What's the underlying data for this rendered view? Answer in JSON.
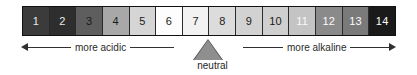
{
  "figure": {
    "name": "ph-scale",
    "background": "#ffffff"
  },
  "scale": {
    "cells": [
      {
        "label": "1",
        "fill": "#3b3b3b",
        "text_color": "#e8e8e8"
      },
      {
        "label": "2",
        "fill": "#2e2e2e",
        "text_color": "#e8e8e8"
      },
      {
        "label": "3",
        "fill": "#5e5e5e",
        "text_color": "#1a1a1a"
      },
      {
        "label": "4",
        "fill": "#a8a8a8",
        "text_color": "#1a1a1a"
      },
      {
        "label": "5",
        "fill": "#d5d5d5",
        "text_color": "#1a1a1a"
      },
      {
        "label": "6",
        "fill": "#fdfdfd",
        "text_color": "#1a1a1a"
      },
      {
        "label": "7",
        "fill": "#f2f2f2",
        "text_color": "#1a1a1a"
      },
      {
        "label": "8",
        "fill": "#dcdcdc",
        "text_color": "#1a1a1a"
      },
      {
        "label": "9",
        "fill": "#d2d2d2",
        "text_color": "#1a1a1a"
      },
      {
        "label": "10",
        "fill": "#cfcfcf",
        "text_color": "#1a1a1a"
      },
      {
        "label": "11",
        "fill": "#c4c4c4",
        "text_color": "#fbfbfb"
      },
      {
        "label": "12",
        "fill": "#8a8a8a",
        "text_color": "#fbfbfb"
      },
      {
        "label": "13",
        "fill": "#7a7a7a",
        "text_color": "#fbfbfb"
      },
      {
        "label": "14",
        "fill": "#1a1a1a",
        "text_color": "#fbfbfb"
      }
    ]
  },
  "axis": {
    "left_label": "more acidic",
    "right_label": "more alkaline",
    "line_color": "#303030"
  },
  "neutral": {
    "label": "neutral",
    "marker_fill": "#8f8f8f",
    "marker_stroke": "#4a4a4a"
  },
  "chart_data": {
    "type": "bar",
    "xlabel": "",
    "ylabel": "",
    "categories": [
      "1",
      "2",
      "3",
      "4",
      "5",
      "6",
      "7",
      "8",
      "9",
      "10",
      "11",
      "12",
      "13",
      "14"
    ],
    "values": [
      1,
      2,
      3,
      4,
      5,
      6,
      7,
      8,
      9,
      10,
      11,
      12,
      13,
      14
    ],
    "xlim": [
      1,
      14
    ],
    "grid": false,
    "legend": null,
    "annotations": [
      {
        "text": "more acidic",
        "range": [
          1,
          7
        ],
        "direction": "left"
      },
      {
        "text": "more alkaline",
        "range": [
          7,
          14
        ],
        "direction": "right"
      },
      {
        "text": "neutral",
        "at": 7,
        "marker": "triangle-up"
      }
    ],
    "series": [
      {
        "name": "cell shade (grayscale hex)",
        "values": [
          "#3b3b3b",
          "#2e2e2e",
          "#5e5e5e",
          "#a8a8a8",
          "#d5d5d5",
          "#fdfdfd",
          "#f2f2f2",
          "#dcdcdc",
          "#d2d2d2",
          "#cfcfcf",
          "#c4c4c4",
          "#8a8a8a",
          "#7a7a7a",
          "#1a1a1a"
        ]
      }
    ]
  }
}
